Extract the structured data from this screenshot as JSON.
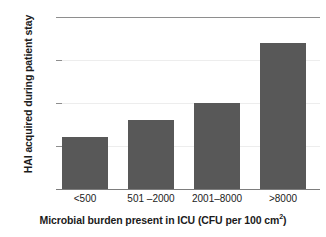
{
  "chart_data": {
    "type": "bar",
    "title": "",
    "categories": [
      "<500",
      "501 –2000",
      "2001–8000",
      ">8000"
    ],
    "values": [
      6,
      8,
      10,
      17
    ],
    "xlabel": "Microbial burden present in ICU (CFU per 100 cm",
    "xlabel_superscript": "2",
    "xlabel_suffix": ")",
    "ylabel": "HAI acquired during patient stay",
    "ylim": [
      0,
      20
    ],
    "yticks": [
      0,
      5,
      10,
      15,
      20
    ],
    "ytick_labels": [
      "0",
      "5",
      "10",
      "15",
      "20"
    ],
    "grid": true,
    "legend": "none",
    "bar_color": "#585858",
    "gridline_color": "#ededed",
    "axis_color": "#7d7d7d",
    "text_color": "#1b1b1b",
    "background_color": "#ffffff"
  }
}
